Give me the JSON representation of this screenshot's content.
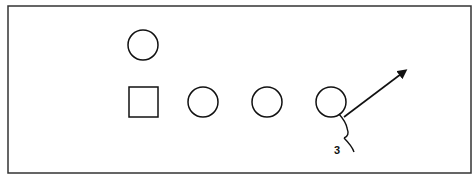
{
  "diagram": {
    "type": "play-diagram",
    "frame": {
      "x": 8,
      "y": 6,
      "w": 463,
      "h": 167
    },
    "stroke_color": "#111111",
    "background": "#ffffff",
    "players": [
      {
        "id": "top-circle",
        "shape": "circle",
        "cx": 143,
        "cy": 45,
        "r": 15
      },
      {
        "id": "square",
        "shape": "square",
        "x": 129,
        "y": 87,
        "size": 29
      },
      {
        "id": "circle-2",
        "shape": "circle",
        "cx": 203,
        "cy": 102,
        "r": 15
      },
      {
        "id": "circle-3",
        "shape": "circle",
        "cx": 267,
        "cy": 102,
        "r": 15
      },
      {
        "id": "circle-4",
        "shape": "circle",
        "cx": 331,
        "cy": 102,
        "r": 15
      }
    ],
    "route": {
      "from": [
        344,
        117
      ],
      "to": [
        405,
        71
      ],
      "arrowhead": true
    },
    "motion_label": "3"
  }
}
